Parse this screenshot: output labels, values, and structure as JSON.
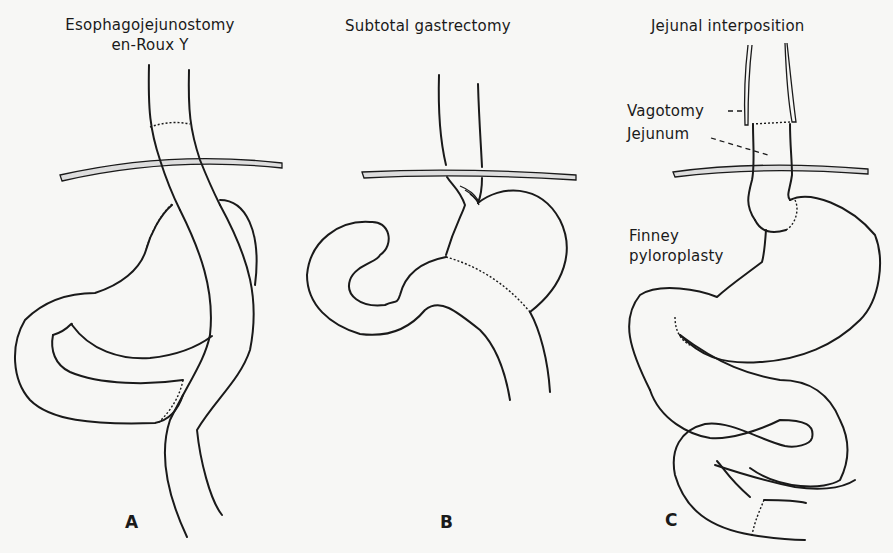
{
  "figure": {
    "panels": [
      {
        "id": "A",
        "letter": "A",
        "title_line1": "Esophagojejunostomy",
        "title_line2": "en-Roux  Y"
      },
      {
        "id": "B",
        "letter": "B",
        "title_line1": "Subtotal  gastrectomy"
      },
      {
        "id": "C",
        "letter": "C",
        "title_line1": "Jejunal  interposition",
        "annotations": {
          "vagotomy": "Vagotomy",
          "jejunum": "Jejunum",
          "finney_line1": "Finney",
          "finney_line2": "pyloroplasty"
        }
      }
    ],
    "colors": {
      "ink": "#1a1a1a",
      "paper": "#f7f7f5"
    }
  }
}
